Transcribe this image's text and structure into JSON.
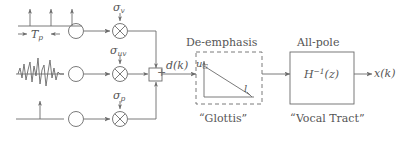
{
  "figure": {
    "stroke_color": "#6b6b6b",
    "text_color": "#555555",
    "background": "#ffffff"
  },
  "sources": [
    {
      "id": "impulse-train",
      "waveform": "periodic-impulse-train",
      "period_label_prefix": "T",
      "period_label_sub": "p",
      "gain_symbol": "σ",
      "gain_sub": "v",
      "generator": "circle-node",
      "multiplier": "multiply-operator"
    },
    {
      "id": "white-noise",
      "waveform": "random-noise",
      "period_label_prefix": "",
      "period_label_sub": "",
      "gain_symbol": "σ",
      "gain_sub": "uv",
      "generator": "circle-node",
      "multiplier": "multiply-operator"
    },
    {
      "id": "single-impulse",
      "waveform": "single-impulse",
      "period_label_prefix": "",
      "period_label_sub": "",
      "gain_symbol": "σ",
      "gain_sub": "p",
      "generator": "circle-node",
      "multiplier": "multiply-operator"
    }
  ],
  "summer": {
    "operator": "+",
    "output_label": "d(k)"
  },
  "deemphasis_block": {
    "title": "De-emphasis",
    "caption": "“Glottis”",
    "y_axis_label": "u",
    "y_axis_sub": "G",
    "x_axis_label": "l",
    "shape": "decaying-ramp"
  },
  "allpole_block": {
    "title": "All-pole",
    "transfer_function_base": "H",
    "transfer_function_exp": "−1",
    "transfer_function_arg": "(z)",
    "caption": "“Vocal Tract”"
  },
  "output": {
    "label": "x(k)"
  }
}
